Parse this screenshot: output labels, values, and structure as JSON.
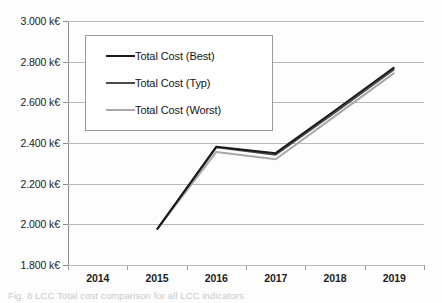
{
  "chart_data": {
    "type": "line",
    "title": "",
    "xlabel": "",
    "ylabel": "",
    "categories": [
      "2014",
      "2015",
      "2016",
      "2017",
      "2018",
      "2019"
    ],
    "x": [
      2014,
      2015,
      2016,
      2017,
      2018,
      2019
    ],
    "ylim": [
      1800,
      3000
    ],
    "ytick_step": 200,
    "ytick_labels": [
      "3.000 k€",
      "2.800 k€",
      "2.600 k€",
      "2.400 k€",
      "2.200 k€",
      "2.000 k€",
      "1.800 k€"
    ],
    "ytick_values": [
      3000,
      2800,
      2600,
      2400,
      2200,
      2000,
      1800
    ],
    "xtick_labels": [
      "2014",
      "2015",
      "2016",
      "2017",
      "2018",
      "2019"
    ],
    "grid": "horizontal",
    "legend_position": "upper-left-inside",
    "units": "k€",
    "series": [
      {
        "name": "Total Cost (Best)",
        "color": "#1a1a1a",
        "values": [
          null,
          1975,
          2382,
          2350,
          2560,
          2772
        ]
      },
      {
        "name": "Total Cost (Typ)",
        "color": "#4a4a4a",
        "values": [
          null,
          1975,
          2378,
          2342,
          2550,
          2762
        ]
      },
      {
        "name": "Total Cost (Worst)",
        "color": "#a8a8a8",
        "values": [
          null,
          1975,
          2356,
          2320,
          2532,
          2745
        ]
      }
    ]
  },
  "legend": {
    "entries": [
      {
        "label": "Total Cost (Best)"
      },
      {
        "label": "Total Cost (Typ)"
      },
      {
        "label": "Total Cost (Worst)"
      }
    ]
  },
  "caption": {
    "text": "Fig. 8  LCC Total cost comparison for all LCC indicators"
  }
}
